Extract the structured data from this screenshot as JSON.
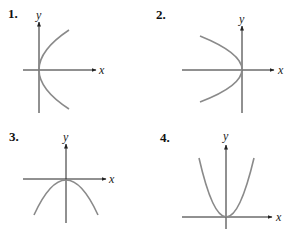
{
  "panels": [
    {
      "label": "1.",
      "x_label": "x",
      "y_label": "y",
      "curve": "parabola opening right, vertex at origin"
    },
    {
      "label": "2.",
      "x_label": "x",
      "y_label": "y",
      "curve": "parabola opening left, vertex at origin"
    },
    {
      "label": "3.",
      "x_label": "x",
      "y_label": "y",
      "curve": "parabola opening down, vertex at origin"
    },
    {
      "label": "4.",
      "x_label": "x",
      "y_label": "y",
      "curve": "parabola opening up, vertex at origin"
    }
  ],
  "colors": {
    "axis": "#222222",
    "curve": "#8a8a8a"
  }
}
